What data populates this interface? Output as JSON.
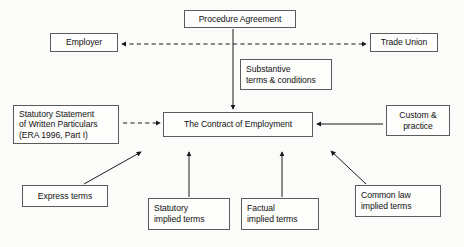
{
  "diagram": {
    "title": "The Contract of Employment",
    "colors": {
      "background": "#fbfbf9",
      "box_border": "#5b5b5b",
      "box_fill": "#fdfdfc",
      "text": "#121212",
      "edge": "#1a1a1a"
    },
    "nodes": {
      "procedure_agreement": {
        "lines": [
          "Procedure Agreement"
        ]
      },
      "employer": {
        "lines": [
          "Employer"
        ]
      },
      "trade_union": {
        "lines": [
          "Trade Union"
        ]
      },
      "substantive": {
        "lines": [
          "Substantive",
          "terms & conditions"
        ]
      },
      "statutory_statement": {
        "lines": [
          "Statutory Statement",
          "of Written Particulars",
          "(ERA 1996, Part I)"
        ]
      },
      "contract": {
        "lines": [
          "The Contract of Employment"
        ]
      },
      "custom_practice": {
        "lines": [
          "Custom &",
          "practice"
        ]
      },
      "express_terms": {
        "lines": [
          "Express terms"
        ]
      },
      "statutory_implied": {
        "lines": [
          "Statutory",
          "implied terms"
        ]
      },
      "factual_implied": {
        "lines": [
          "Factual",
          "implied terms"
        ]
      },
      "common_law_implied": {
        "lines": [
          "Common law",
          "implied terms"
        ]
      }
    },
    "edges": [
      {
        "name": "employer-trade-union-link",
        "style": "dashed",
        "arrows": "both"
      },
      {
        "name": "procedure-agreement-to-contract",
        "style": "solid",
        "arrows": "end"
      },
      {
        "name": "statutory-statement-to-contract",
        "style": "dashed",
        "arrows": "end"
      },
      {
        "name": "custom-practice-to-contract",
        "style": "solid",
        "arrows": "end"
      },
      {
        "name": "express-terms-to-contract",
        "style": "solid",
        "arrows": "end"
      },
      {
        "name": "statutory-implied-to-contract",
        "style": "solid",
        "arrows": "end"
      },
      {
        "name": "factual-implied-to-contract",
        "style": "solid",
        "arrows": "end"
      },
      {
        "name": "common-law-implied-to-contract",
        "style": "solid",
        "arrows": "end"
      }
    ]
  }
}
